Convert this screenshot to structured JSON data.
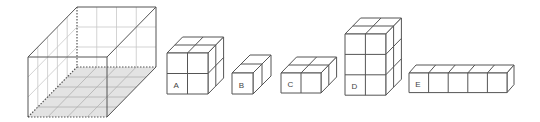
{
  "diagram": {
    "colors": {
      "edge": "#555555",
      "grid": "#c8c8c8",
      "floor": "#e3e3e3",
      "label": "#444444"
    },
    "big_box": {
      "front": {
        "x": 28,
        "y": 57,
        "w": 79,
        "h": 60
      },
      "depth_offset": {
        "dx": 49,
        "dy": -50
      },
      "back_wall_grid": {
        "cols": 4,
        "rows": 3
      },
      "side_wall_grid": {
        "depth": 5,
        "rows": 3
      },
      "floor_grid": {
        "cols": 4,
        "depth": 5
      },
      "floor_shaded": true
    },
    "blocks": [
      {
        "label": "A",
        "x": 167,
        "y": 53,
        "unit": 20.5,
        "width": 2,
        "height": 2,
        "depth": 2,
        "ddx": 7.8,
        "ddy": -8
      },
      {
        "label": "B",
        "x": 232,
        "y": 73,
        "unit": 21,
        "width": 1,
        "height": 1,
        "depth": 2,
        "ddx": 9,
        "ddy": -9
      },
      {
        "label": "C",
        "x": 281,
        "y": 73,
        "unit": 20,
        "width": 2,
        "height": 1,
        "depth": 2,
        "ddx": 7.8,
        "ddy": -8
      },
      {
        "label": "D",
        "x": 345,
        "y": 34,
        "unit": 20.4,
        "width": 2,
        "height": 3,
        "depth": 2,
        "ddx": 7.8,
        "ddy": -8
      },
      {
        "label": "E",
        "x": 409,
        "y": 73,
        "unit": 19.6,
        "width": 5,
        "height": 1,
        "depth": 1,
        "ddx": 7,
        "ddy": -8
      }
    ]
  }
}
